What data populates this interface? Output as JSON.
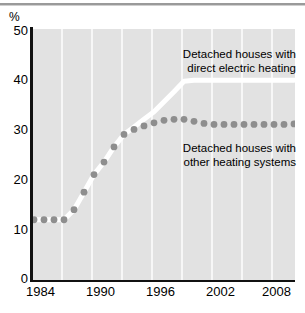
{
  "chart_data": {
    "type": "line",
    "title": "",
    "subtitle": "",
    "xlabel": "",
    "ylabel": "%",
    "ylim": [
      0,
      50
    ],
    "xlim": [
      1984,
      2010
    ],
    "yticks": [
      0,
      10,
      20,
      30,
      40,
      50
    ],
    "xticks": [
      1984,
      1990,
      1996,
      2002,
      2008
    ],
    "ytick_labels": [
      "0",
      "10",
      "20",
      "30",
      "40",
      "50"
    ],
    "xtick_labels": [
      "1984",
      "1990",
      "1996",
      "2002",
      "2008"
    ],
    "grid": "vertical",
    "legend_position": "inline-annotations",
    "x": [
      1984,
      1985,
      1986,
      1987,
      1988,
      1989,
      1990,
      1991,
      1992,
      1993,
      1994,
      1995,
      1996,
      1997,
      1998,
      1999,
      2000,
      2001,
      2002,
      2003,
      2004,
      2005,
      2006,
      2007,
      2008,
      2009,
      2010
    ],
    "series": [
      {
        "name": "Detached houses with direct electric heating",
        "style": "white-line",
        "color": "#ffffff",
        "values": [
          12.0,
          12.0,
          12.0,
          12.0,
          14.0,
          17.5,
          21.0,
          23.5,
          26.5,
          29.0,
          30.5,
          32.0,
          33.5,
          35.5,
          37.5,
          39.6,
          39.8,
          39.8,
          39.8,
          39.8,
          39.8,
          39.8,
          39.8,
          39.8,
          39.8,
          39.8,
          39.8
        ]
      },
      {
        "name": "Detached houses with other heating systems",
        "style": "dotted",
        "color": "#8e8e8e",
        "values": [
          12.0,
          12.0,
          12.0,
          12.0,
          14.0,
          17.5,
          21.0,
          23.5,
          26.5,
          29.0,
          30.0,
          30.7,
          31.3,
          31.8,
          32.0,
          32.0,
          31.6,
          31.2,
          31.0,
          31.0,
          31.0,
          31.0,
          31.0,
          31.0,
          31.0,
          31.0,
          31.1
        ]
      }
    ],
    "annotations": [
      {
        "id": "electric",
        "line1": "Detached houses with",
        "line2": "direct electric heating"
      },
      {
        "id": "other",
        "line1": "Detached houses with",
        "line2": "other heating systems"
      }
    ]
  },
  "colors": {
    "plot_background": "#e2e2e2",
    "gridline": "#f7f7f7",
    "axis": "#111111",
    "dotted_series": "#8e8e8e",
    "line_series": "#ffffff",
    "page_background": "#ffffff",
    "top_rule": "#9a9a9a"
  }
}
